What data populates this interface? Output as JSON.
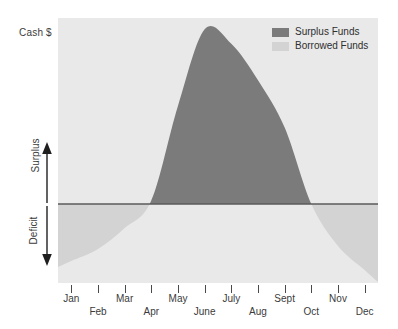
{
  "axis": {
    "y_title": "Cash $",
    "surplus_label": "Surplus",
    "deficit_label": "Deficit"
  },
  "legend": {
    "position": "top-right",
    "items": [
      {
        "label": "Surplus Funds",
        "color": "#7b7b7b",
        "icon": "legend-swatch-icon"
      },
      {
        "label": "Borrowed Funds",
        "color": "#d3d3d3",
        "icon": "legend-swatch-icon"
      }
    ]
  },
  "colors": {
    "plot_background": "#e9e9e9",
    "surplus_fill": "#7b7b7b",
    "borrowed_fill": "#d3d3d3",
    "zero_line": "#5a5a5a",
    "text": "#3b3b3b"
  },
  "chart_data": {
    "type": "area",
    "title": "",
    "subtitle": "",
    "xlabel": "",
    "ylabel": "Cash $",
    "grid": false,
    "legend_position": "top-right",
    "annotations": [
      {
        "text": "Surplus",
        "direction": "up",
        "region": "above-zero-line"
      },
      {
        "text": "Deficit",
        "direction": "down",
        "region": "below-zero-line"
      }
    ],
    "zero_line": 0,
    "ylim": [
      -50,
      100
    ],
    "categories": [
      "Jan",
      "Feb",
      "Mar",
      "Apr",
      "May",
      "June",
      "July",
      "Aug",
      "Sept",
      "Oct",
      "Nov",
      "Dec"
    ],
    "tick_label_rows": [
      0,
      1,
      0,
      1,
      0,
      1,
      0,
      1,
      0,
      1,
      0,
      1
    ],
    "series": [
      {
        "name": "Cash position",
        "values": [
          -38,
          -30,
          -16,
          2,
          54,
          96,
          88,
          68,
          42,
          0,
          -28,
          -44
        ]
      }
    ],
    "zero_crossings": [
      "Apr",
      "Oct"
    ],
    "peak": {
      "category": "June",
      "value": 96
    },
    "trough": {
      "category": "Dec",
      "value": -44
    }
  },
  "xaxis": {
    "ticks": [
      {
        "label": "Jan",
        "row": 0
      },
      {
        "label": "Feb",
        "row": 1
      },
      {
        "label": "Mar",
        "row": 0
      },
      {
        "label": "Apr",
        "row": 1
      },
      {
        "label": "May",
        "row": 0
      },
      {
        "label": "June",
        "row": 1
      },
      {
        "label": "July",
        "row": 0
      },
      {
        "label": "Aug",
        "row": 1
      },
      {
        "label": "Sept",
        "row": 0
      },
      {
        "label": "Oct",
        "row": 1
      },
      {
        "label": "Nov",
        "row": 0
      },
      {
        "label": "Dec",
        "row": 1
      }
    ]
  }
}
